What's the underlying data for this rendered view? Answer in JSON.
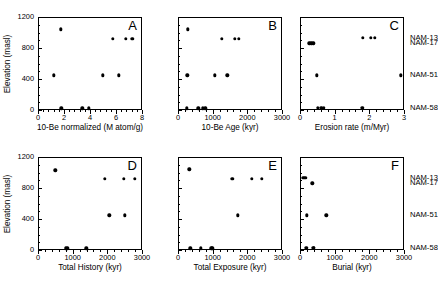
{
  "figure": {
    "ylabel": "Elevation (masl)",
    "ylim": [
      0,
      1200
    ],
    "yticks": [
      0,
      400,
      800,
      1200
    ],
    "sample_labels": [
      {
        "name": "NAM-13",
        "elevation": 930
      },
      {
        "name": "NAM-17",
        "elevation": 860
      },
      {
        "name": "NAM-51",
        "elevation": 450
      },
      {
        "name": "NAM-58",
        "elevation": 30
      }
    ]
  },
  "chart_data": [
    {
      "type": "scatter",
      "panel": "A",
      "title": "",
      "xlabel": "10-Be normalized (M atom/g)",
      "ylabel": "Elevation (masl)",
      "xlim": [
        0,
        8
      ],
      "ylim": [
        0,
        1200
      ],
      "xticks": [
        0,
        2,
        4,
        6,
        8
      ],
      "yticks": [
        0,
        400,
        800,
        1200
      ],
      "grid": false,
      "x": [
        1.75,
        5.75,
        6.75,
        7.25,
        1.2,
        5.0,
        6.2,
        1.8,
        3.4,
        3.9
      ],
      "y": [
        1040,
        920,
        920,
        920,
        450,
        450,
        450,
        20,
        20,
        20
      ]
    },
    {
      "type": "scatter",
      "panel": "B",
      "title": "",
      "xlabel": "10-Be Age (kyr)",
      "ylabel": "Elevation (masl)",
      "xlim": [
        0,
        3000
      ],
      "ylim": [
        0,
        1200
      ],
      "xticks": [
        0,
        1000,
        2000,
        3000
      ],
      "yticks": [
        0,
        400,
        800,
        1200
      ],
      "grid": false,
      "x": [
        290,
        1270,
        1640,
        1760,
        270,
        1060,
        1420,
        250,
        590,
        720,
        790
      ],
      "y": [
        1040,
        920,
        920,
        920,
        450,
        450,
        450,
        20,
        20,
        20,
        20
      ]
    },
    {
      "type": "scatter",
      "panel": "C",
      "title": "",
      "xlabel": "Erosion rate (m/Myr)",
      "ylabel": "Elevation (masl)",
      "xlim": [
        0,
        3
      ],
      "ylim": [
        0,
        1200
      ],
      "xticks": [
        0,
        1,
        2,
        3
      ],
      "yticks": [
        0,
        400,
        800,
        1200
      ],
      "grid": false,
      "x": [
        1.82,
        2.05,
        2.15,
        0.27,
        0.33,
        0.38,
        0.48,
        2.9,
        0.52,
        0.62,
        0.68,
        1.8
      ],
      "y": [
        930,
        930,
        930,
        860,
        860,
        860,
        450,
        450,
        30,
        30,
        30,
        30
      ]
    },
    {
      "type": "scatter",
      "panel": "D",
      "title": "",
      "xlabel": "Total History (kyr)",
      "ylabel": "Elevation (masl)",
      "xlim": [
        0,
        3000
      ],
      "ylim": [
        0,
        1200
      ],
      "xticks": [
        0,
        1000,
        2000,
        3000
      ],
      "yticks": [
        0,
        400,
        800,
        1200
      ],
      "grid": false,
      "x": [
        500,
        1920,
        2480,
        2800,
        2060,
        2500,
        800,
        840,
        1390
      ],
      "y": [
        1030,
        920,
        920,
        920,
        450,
        450,
        20,
        20,
        20
      ]
    },
    {
      "type": "scatter",
      "panel": "E",
      "title": "",
      "xlabel": "Total Exposure (kyr)",
      "ylabel": "Elevation (masl)",
      "xlim": [
        0,
        3000
      ],
      "ylim": [
        0,
        1200
      ],
      "xticks": [
        0,
        1000,
        2000,
        3000
      ],
      "yticks": [
        0,
        400,
        800,
        1200
      ],
      "grid": false,
      "x": [
        330,
        1570,
        2130,
        2410,
        1720,
        350,
        650,
        960,
        990
      ],
      "y": [
        1040,
        920,
        920,
        920,
        450,
        20,
        20,
        20,
        20
      ]
    },
    {
      "type": "scatter",
      "panel": "F",
      "title": "",
      "xlabel": "Burial (kyr)",
      "ylabel": "Elevation (masl)",
      "xlim": [
        0,
        3000
      ],
      "ylim": [
        0,
        1200
      ],
      "xticks": [
        0,
        1000,
        2000,
        3000
      ],
      "yticks": [
        0,
        400,
        800,
        1200
      ],
      "grid": false,
      "x": [
        90,
        150,
        360,
        190,
        760,
        180,
        380,
        400
      ],
      "y": [
        930,
        930,
        860,
        450,
        450,
        30,
        30,
        30
      ]
    }
  ]
}
